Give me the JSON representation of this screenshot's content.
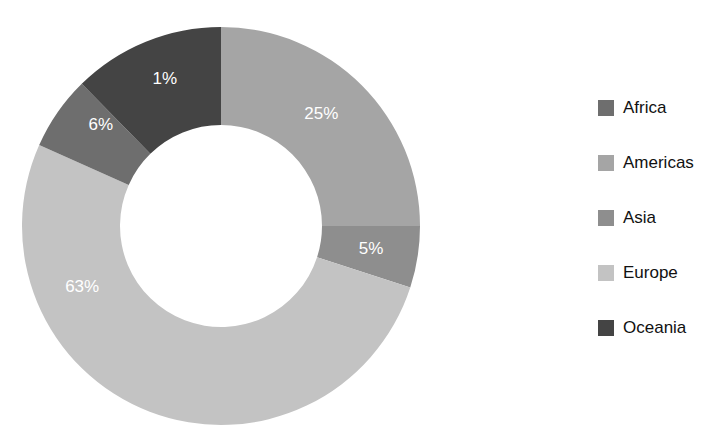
{
  "chart_data": {
    "type": "pie",
    "variant": "donut",
    "title": "",
    "subtitle": "",
    "xlabel": "",
    "ylabel": "",
    "grid": false,
    "legend_position": "right",
    "start_angle_deg": 0,
    "direction": "clockwise",
    "hole_ratio": 0.51,
    "labels": [
      "Africa",
      "Americas",
      "Asia",
      "Europe",
      "Oceania"
    ],
    "values": [
      6,
      25,
      5,
      63,
      1
    ],
    "value_unit": "%",
    "data_labels": [
      "6%",
      "25%",
      "5%",
      "63%",
      "1%"
    ],
    "draw_order": [
      "Americas",
      "Asia",
      "Europe",
      "Africa",
      "Oceania"
    ],
    "slices": [
      {
        "name": "Africa",
        "value": 6,
        "data_label": "6%",
        "color": "#6e6e6e",
        "label_color": "#ffffff",
        "start_deg": 294,
        "end_deg": 315.6
      },
      {
        "name": "Americas",
        "value": 25,
        "data_label": "25%",
        "color": "#a5a5a5",
        "label_color": "#ffffff",
        "start_deg": 0,
        "end_deg": 90
      },
      {
        "name": "Asia",
        "value": 5,
        "data_label": "5%",
        "color": "#8e8e8e",
        "label_color": "#ffffff",
        "start_deg": 90,
        "end_deg": 108
      },
      {
        "name": "Europe",
        "value": 63,
        "data_label": "63%",
        "color": "#c3c3c3",
        "label_color": "#ffffff",
        "start_deg": 108,
        "end_deg": 294
      },
      {
        "name": "Oceania",
        "value": 1,
        "data_label": "1%",
        "color": "#444444",
        "label_color": "#ffffff",
        "start_deg": 315.6,
        "end_deg": 360
      }
    ]
  },
  "legend": {
    "items": [
      {
        "label": "Africa",
        "color": "#6e6e6e"
      },
      {
        "label": "Americas",
        "color": "#a5a5a5"
      },
      {
        "label": "Asia",
        "color": "#8e8e8e"
      },
      {
        "label": "Europe",
        "color": "#c3c3c3"
      },
      {
        "label": "Oceania",
        "color": "#444444"
      }
    ]
  },
  "geometry": {
    "center_x": 221,
    "center_y": 226,
    "outer_radius": 199,
    "inner_radius": 101,
    "label_radius": 150
  }
}
